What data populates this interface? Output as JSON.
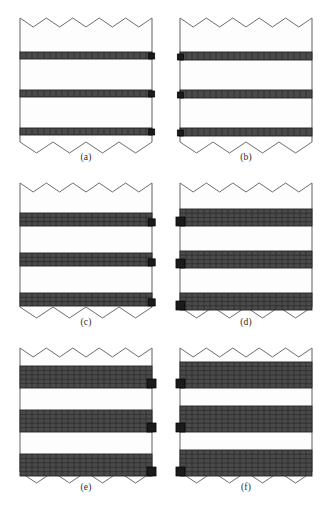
{
  "figure": {
    "title": "",
    "panel_count": 6,
    "columns": 2,
    "rows": 3,
    "background_color": "#ffffff",
    "outline_color": "#6e6e6e",
    "band_fill_color": "#4a4a4a",
    "band_grid_color": "#2a2a2a",
    "marker_color": "#1b1b1b",
    "specimen_fill_color": "#fdfdfd",
    "panels": [
      {
        "id": "a",
        "caption": "(a)",
        "marker_side": "right",
        "band_count": 3,
        "band_rows": 1,
        "band_cols": 22,
        "band_thickness_px": 7,
        "band_label": "reinforcement-layer",
        "band_offsets_px": [
          34,
          72,
          110
        ],
        "zigzag_top_teeth": 5,
        "zigzag_bottom_teeth": 4
      },
      {
        "id": "b",
        "caption": "(b)",
        "marker_side": "left",
        "band_count": 3,
        "band_rows": 1,
        "band_cols": 22,
        "band_thickness_px": 8,
        "band_label": "reinforcement-layer",
        "band_offsets_px": [
          34,
          72,
          110
        ],
        "zigzag_top_teeth": 5,
        "zigzag_bottom_teeth": 4
      },
      {
        "id": "c",
        "caption": "(c)",
        "marker_side": "right",
        "band_count": 3,
        "band_rows": 3,
        "band_cols": 22,
        "band_thickness_px": 13,
        "band_label": "reinforcement-layer",
        "band_offsets_px": [
          30,
          70,
          110
        ],
        "zigzag_top_teeth": 5,
        "zigzag_bottom_teeth": 4
      },
      {
        "id": "d",
        "caption": "(d)",
        "marker_side": "left",
        "band_count": 3,
        "band_rows": 4,
        "band_cols": 22,
        "band_thickness_px": 17,
        "band_label": "reinforcement-layer",
        "band_offsets_px": [
          26,
          68,
          110
        ],
        "zigzag_top_teeth": 5,
        "zigzag_bottom_teeth": 4
      },
      {
        "id": "e",
        "caption": "(e)",
        "marker_side": "right",
        "band_count": 3,
        "band_rows": 5,
        "band_cols": 22,
        "band_thickness_px": 22,
        "band_label": "reinforcement-layer",
        "band_offsets_px": [
          18,
          62,
          106
        ],
        "zigzag_top_teeth": 5,
        "zigzag_bottom_teeth": 4
      },
      {
        "id": "f",
        "caption": "(f)",
        "marker_side": "left",
        "band_count": 3,
        "band_rows": 6,
        "band_cols": 22,
        "band_thickness_px": 26,
        "band_label": "reinforcement-layer",
        "band_offsets_px": [
          14,
          58,
          102
        ],
        "zigzag_top_teeth": 5,
        "zigzag_bottom_teeth": 4
      }
    ]
  }
}
